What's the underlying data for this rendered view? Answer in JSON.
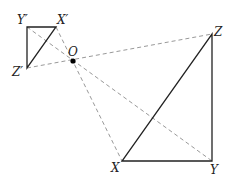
{
  "diagram": {
    "type": "geometry-dilation",
    "center": {
      "label": "O",
      "x": 73,
      "y": 61
    },
    "image_triangle": {
      "vertices": [
        {
          "label": "X′",
          "x": 56,
          "y": 27
        },
        {
          "label": "Y′",
          "x": 27,
          "y": 27
        },
        {
          "label": "Z′",
          "x": 27,
          "y": 68
        }
      ]
    },
    "original_triangle": {
      "vertices": [
        {
          "label": "X",
          "x": 122,
          "y": 161
        },
        {
          "label": "Y",
          "x": 212,
          "y": 161
        },
        {
          "label": "Z",
          "x": 212,
          "y": 34
        }
      ]
    },
    "colors": {
      "solid": "#222222",
      "dashed": "#999999",
      "point": "#000000"
    }
  }
}
